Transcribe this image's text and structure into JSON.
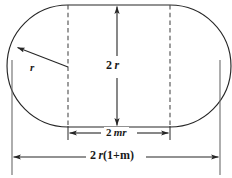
{
  "figure": {
    "shape_name": "stadium",
    "stroke_color": "#262626",
    "background_color": "#ffffff",
    "dashed_color": "#4d4d4d",
    "labels": {
      "radius": "r",
      "height": "2 r",
      "inner_width": "2 mr",
      "total_width": "2 r(1+m)"
    },
    "label_parts": {
      "radius": {
        "coefficient": "",
        "variable": "r"
      },
      "height": {
        "coefficient": "2",
        "variable": "r"
      },
      "inner_width": {
        "coefficient": "2",
        "variable": "mr"
      },
      "total_width": {
        "coefficient": "2",
        "variable": "r",
        "expression": "(1+m)"
      }
    },
    "annotations": [
      {
        "name": "radius-arrow",
        "label": "r",
        "orientation": "diagonal",
        "description": "radius of left semicircular end"
      },
      {
        "name": "height-arrow",
        "label": "2 r",
        "orientation": "vertical",
        "description": "overall height equals diameter"
      },
      {
        "name": "inner-width-arrow",
        "label": "2 mr",
        "orientation": "horizontal",
        "description": "length of straight rectangular middle section"
      },
      {
        "name": "total-width-arrow",
        "label": "2 r(1+m)",
        "orientation": "horizontal",
        "description": "overall width of the stadium"
      }
    ],
    "geometry": {
      "left_edge_x": 12,
      "right_edge_x": 220,
      "top_y": 5,
      "bottom_y": 127,
      "left_dashed_x": 68,
      "right_dashed_x": 170,
      "center_y": 66,
      "height_arrow_x": 117,
      "inner_dim_y": 133,
      "total_dim_y": 157
    }
  }
}
